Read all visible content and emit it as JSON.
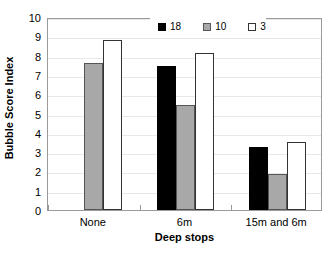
{
  "chart_data": {
    "type": "bar",
    "title": "",
    "xlabel": "Deep stops",
    "ylabel": "Bubble Score Index",
    "categories": [
      "None",
      "6m",
      "15m and 6m"
    ],
    "series": [
      {
        "name": "18",
        "color": "#000000",
        "values": [
          null,
          7.45,
          3.25
        ]
      },
      {
        "name": "10",
        "color": "#a8a8a8",
        "values": [
          7.6,
          5.45,
          1.85
        ]
      },
      {
        "name": "3",
        "color": "#ffffff",
        "values": [
          8.8,
          8.15,
          3.55
        ]
      }
    ],
    "ylim": [
      0,
      10
    ],
    "yticks": [
      0,
      1,
      2,
      3,
      4,
      5,
      6,
      7,
      8,
      9,
      10
    ],
    "ytick_labels": [
      "0",
      "1",
      "2",
      "3",
      "4",
      "5",
      "6",
      "7",
      "8",
      "9",
      "10"
    ],
    "grid": true,
    "grid_axis": "y",
    "legend_position": "top-center-right",
    "legend_entries": [
      "18",
      "10",
      "3"
    ]
  }
}
